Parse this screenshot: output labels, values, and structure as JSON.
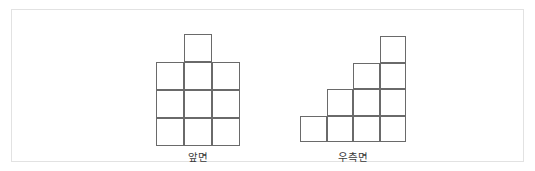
{
  "panel": {
    "background_color": "#ffffff",
    "border_color": "#e2e2e2"
  },
  "style": {
    "grid_line_color": "#6a6a6a",
    "cell_fill_color": "#ffffff",
    "label_color": "#3a3a3a"
  },
  "figures": [
    {
      "id": "front-view",
      "label": "앞면",
      "cell_size": 28,
      "origin_x": 11,
      "origin_y": 0,
      "description": "3 by 3 block of squares with one extra square on top of the middle column",
      "total_squares": 10,
      "column_heights": [
        3,
        4,
        3
      ],
      "cells": [
        {
          "col": 1,
          "row": 0
        },
        {
          "col": 0,
          "row": 1
        },
        {
          "col": 1,
          "row": 1
        },
        {
          "col": 2,
          "row": 1
        },
        {
          "col": 0,
          "row": 2
        },
        {
          "col": 1,
          "row": 2
        },
        {
          "col": 2,
          "row": 2
        },
        {
          "col": 0,
          "row": 3
        },
        {
          "col": 1,
          "row": 3
        },
        {
          "col": 2,
          "row": 3
        }
      ]
    },
    {
      "id": "right-side-view",
      "label": "우측면",
      "cell_size": 26.5,
      "origin_x": 11,
      "origin_y": 2,
      "description": "staircase of four columns with heights one, two, three and four from left to right",
      "total_squares": 10,
      "column_heights": [
        1,
        2,
        3,
        4
      ],
      "cells": [
        {
          "col": 3,
          "row": 0
        },
        {
          "col": 2,
          "row": 1
        },
        {
          "col": 3,
          "row": 1
        },
        {
          "col": 1,
          "row": 2
        },
        {
          "col": 2,
          "row": 2
        },
        {
          "col": 3,
          "row": 2
        },
        {
          "col": 0,
          "row": 3
        },
        {
          "col": 1,
          "row": 3
        },
        {
          "col": 2,
          "row": 3
        },
        {
          "col": 3,
          "row": 3
        }
      ]
    }
  ]
}
